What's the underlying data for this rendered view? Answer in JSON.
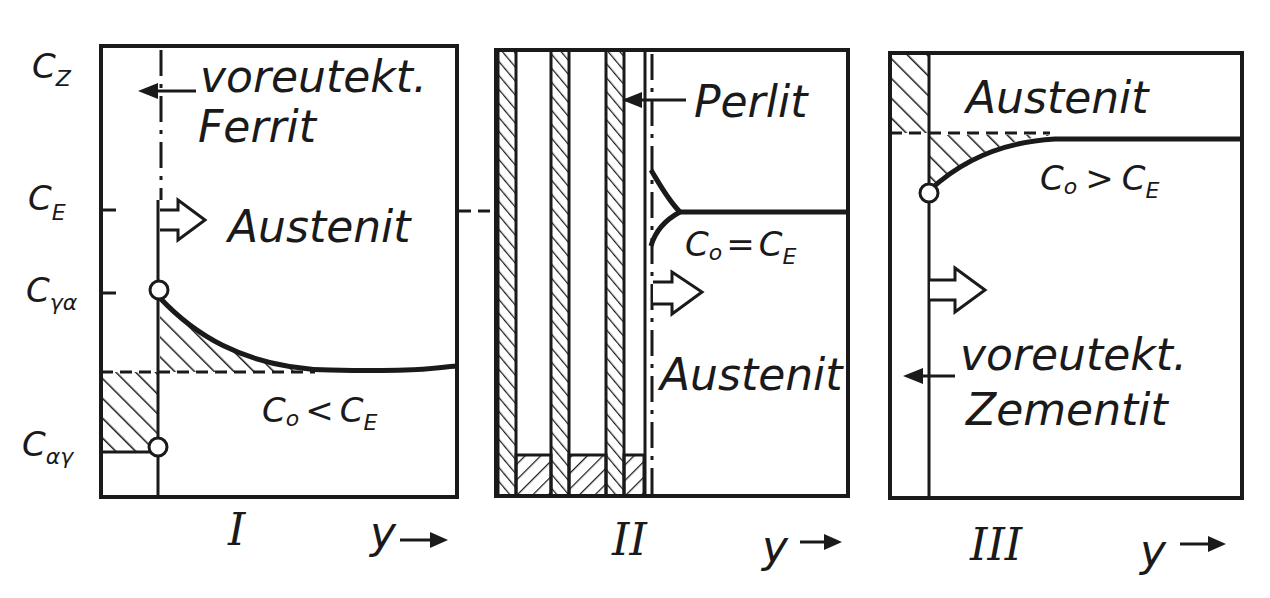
{
  "diagram": {
    "type": "three-panel phase transformation schematic (iron-carbon, eutectoid)",
    "y_axis_labels": {
      "cz": {
        "main": "C",
        "sub": "Z"
      },
      "ce": {
        "main": "C",
        "sub": "E"
      },
      "cga": {
        "main": "C",
        "sub": "γα"
      },
      "cag": {
        "main": "C",
        "sub": "αγ"
      }
    },
    "panels": [
      {
        "id": "I",
        "roman": "I",
        "x_label": "y",
        "labels": {
          "phase_left_1": "voreutekt.",
          "phase_left_2": "Ferrit",
          "phase_right": "Austenit",
          "condition": {
            "left": "C",
            "left_sub": "o",
            "op": "<",
            "right": "C",
            "right_sub": "E"
          }
        }
      },
      {
        "id": "II",
        "roman": "II",
        "x_label": "y",
        "labels": {
          "phase_left": "Perlit",
          "phase_right": "Austenit",
          "condition": {
            "left": "C",
            "left_sub": "o",
            "op": "=",
            "right": "C",
            "right_sub": "E"
          }
        }
      },
      {
        "id": "III",
        "roman": "III",
        "x_label": "y",
        "labels": {
          "phase_top": "Austenit",
          "phase_left_1": "voreutekt.",
          "phase_left_2": "Zementit",
          "condition": {
            "left": "C",
            "left_sub": "o",
            "op": ">",
            "right": "C",
            "right_sub": "E"
          }
        }
      }
    ],
    "colors": {
      "ink": "#1a1a1a",
      "paper": "#ffffff"
    }
  }
}
